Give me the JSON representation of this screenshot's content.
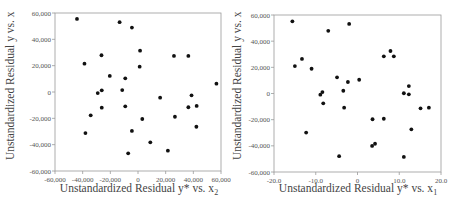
{
  "chart_data": [
    {
      "type": "scatter",
      "title": "",
      "xlabel": "Unstandardized Residual y* vs. x",
      "xlabel_subscript": "2",
      "ylabel": "Unstandardized Residual y vs. x",
      "xlim": [
        -60000,
        60000
      ],
      "ylim": [
        -60000,
        60000
      ],
      "x_ticks": [
        -60000,
        -40000,
        -20000,
        0,
        20000,
        40000,
        60000
      ],
      "x_tick_labels": [
        "-60,000",
        "-40,000",
        "-20,000",
        "0",
        "20,000",
        "40,000",
        "60,000"
      ],
      "y_ticks": [
        60000,
        40000,
        20000,
        0,
        -20000,
        -40000,
        -60000
      ],
      "y_tick_labels": [
        "60,000",
        "40,000",
        "20,000",
        "0",
        "-20,000",
        "-40,000",
        "-60,000"
      ],
      "grid": false,
      "legend": null,
      "points": [
        [
          -44100,
          55500
        ],
        [
          -13300,
          53000
        ],
        [
          -4400,
          48900
        ],
        [
          1500,
          31400
        ],
        [
          -26400,
          27900
        ],
        [
          -38700,
          21500
        ],
        [
          1200,
          19200
        ],
        [
          -20400,
          12200
        ],
        [
          -9200,
          10400
        ],
        [
          -29100,
          -800
        ],
        [
          -26200,
          1300
        ],
        [
          -11400,
          1500
        ],
        [
          -26200,
          -11900
        ],
        [
          -9200,
          -10900
        ],
        [
          -34200,
          -17700
        ],
        [
          -38000,
          -31200
        ],
        [
          -4400,
          -29600
        ],
        [
          -7100,
          -46600
        ],
        [
          26000,
          27400
        ],
        [
          36400,
          27400
        ],
        [
          56700,
          6300
        ],
        [
          16000,
          -4300
        ],
        [
          38700,
          -2500
        ],
        [
          36400,
          -11600
        ],
        [
          42400,
          -10600
        ],
        [
          26700,
          -18800
        ],
        [
          3100,
          -20500
        ],
        [
          42200,
          -26400
        ],
        [
          8900,
          -38200
        ],
        [
          21600,
          -44600
        ]
      ]
    },
    {
      "type": "scatter",
      "title": "",
      "xlabel": "Unstandardized Residual y* vs. x",
      "xlabel_subscript": "1",
      "ylabel": "Unstandardized Residual y vs. x",
      "xlim": [
        -20,
        20
      ],
      "ylim": [
        -60000,
        60000
      ],
      "x_ticks": [
        -20,
        -10,
        0,
        10,
        20
      ],
      "x_tick_labels": [
        "-20.0",
        "-10.0",
        "0",
        "10.0",
        "20.0"
      ],
      "y_ticks": [
        60000,
        40000,
        20000,
        0,
        -20000,
        -40000,
        -60000
      ],
      "y_tick_labels": [
        "60,000",
        "40,000",
        "20,000",
        "0",
        "-20,000",
        "-40,000",
        "-60,000"
      ],
      "grid": false,
      "legend": null,
      "points": [
        [
          -15.6,
          55200
        ],
        [
          -2.0,
          53200
        ],
        [
          -7.0,
          47900
        ],
        [
          -13.3,
          26400
        ],
        [
          -15.0,
          21000
        ],
        [
          -11.0,
          18900
        ],
        [
          -4.9,
          12400
        ],
        [
          -2.3,
          8800
        ],
        [
          0.4,
          10500
        ],
        [
          -3.4,
          2100
        ],
        [
          -8.4,
          1100
        ],
        [
          -8.9,
          -900
        ],
        [
          -8.2,
          -7500
        ],
        [
          -3.2,
          -10800
        ],
        [
          -12.3,
          -29900
        ],
        [
          -4.4,
          -47900
        ],
        [
          7.9,
          32500
        ],
        [
          6.3,
          28400
        ],
        [
          8.7,
          28400
        ],
        [
          12.3,
          5700
        ],
        [
          11.1,
          200
        ],
        [
          12.3,
          -600
        ],
        [
          15.1,
          -11300
        ],
        [
          17.1,
          -10800
        ],
        [
          3.6,
          -19700
        ],
        [
          6.3,
          -19300
        ],
        [
          12.9,
          -27400
        ],
        [
          4.2,
          -38400
        ],
        [
          3.5,
          -40100
        ],
        [
          11.1,
          -48500
        ]
      ]
    }
  ],
  "colors": {
    "marker": "#111111",
    "axis": "#9a9a9a",
    "tick_text": "#555555",
    "label_text": "#444444"
  }
}
